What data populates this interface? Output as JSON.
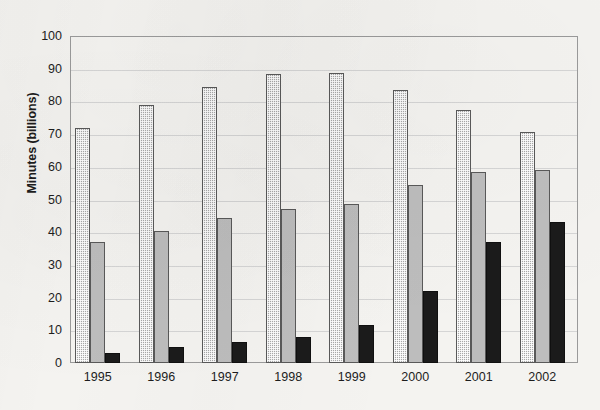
{
  "chart_data": {
    "type": "bar",
    "title": "",
    "xlabel": "",
    "ylabel": "Minutes (billions)",
    "categories": [
      "1995",
      "1996",
      "1997",
      "1998",
      "1999",
      "2000",
      "2001",
      "2002"
    ],
    "series": [
      {
        "name": "series-1",
        "style": "dotted-gray",
        "color": "#a8a8a8",
        "values": [
          72,
          79,
          84.5,
          88.5,
          88.8,
          83.5,
          77.5,
          70.5
        ]
      },
      {
        "name": "series-2",
        "style": "solid-gray",
        "color": "#bdbdbd",
        "values": [
          37,
          40.5,
          44.5,
          47,
          48.5,
          54.5,
          58.5,
          59
        ]
      },
      {
        "name": "series-3",
        "style": "solid-black",
        "color": "#1b1b1b",
        "values": [
          3,
          5,
          6.5,
          8,
          11.5,
          22,
          37,
          43
        ]
      }
    ],
    "ylim": [
      0,
      100
    ],
    "ytick_step": 10,
    "yticks": [
      "0",
      "10",
      "20",
      "30",
      "40",
      "50",
      "60",
      "70",
      "80",
      "90",
      "100"
    ],
    "grid": true,
    "grid_axis": "y",
    "legend": "none",
    "legend_position": "none"
  }
}
